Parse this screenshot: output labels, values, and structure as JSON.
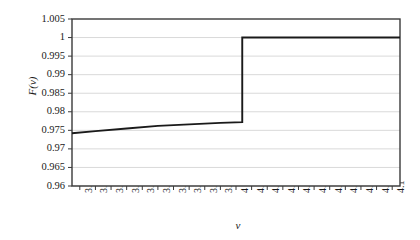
{
  "chart_data": {
    "type": "line",
    "title": "",
    "subtitle": "",
    "xlabel": "v",
    "ylabel": "F(v)",
    "xlim": [
      3.895,
      4.105
    ],
    "ylim": [
      0.96,
      1.005
    ],
    "grid": true,
    "legend": null,
    "x_ticks": [
      "3.9",
      "3.91",
      "3.92",
      "3.93",
      "3.94",
      "3.95",
      "3.96",
      "3.97",
      "3.98",
      "3.99",
      "4",
      "4.01",
      "4.02",
      "4.03",
      "4.04",
      "4.05",
      "4.06",
      "4.07",
      "4.08",
      "4.09",
      "4.1"
    ],
    "x_tick_values": [
      3.9,
      3.91,
      3.92,
      3.93,
      3.94,
      3.95,
      3.96,
      3.97,
      3.98,
      3.99,
      4.0,
      4.01,
      4.02,
      4.03,
      4.04,
      4.05,
      4.06,
      4.07,
      4.08,
      4.09,
      4.1
    ],
    "y_ticks": [
      "0.96",
      "0.965",
      "0.97",
      "0.975",
      "0.98",
      "0.985",
      "0.99",
      "0.995",
      "1",
      "1.005"
    ],
    "y_tick_values": [
      0.96,
      0.965,
      0.97,
      0.975,
      0.98,
      0.985,
      0.99,
      0.995,
      1.0,
      1.005
    ],
    "series": [
      {
        "name": "F(v)",
        "color": "#1a1a1a",
        "x": [
          3.895,
          3.91,
          3.93,
          3.95,
          3.97,
          3.99,
          4.004,
          4.004,
          4.02,
          4.05,
          4.08,
          4.105
        ],
        "y": [
          0.9742,
          0.9748,
          0.9755,
          0.9762,
          0.9766,
          0.977,
          0.9772,
          1.0,
          1.0,
          1.0,
          1.0,
          1.0
        ]
      }
    ],
    "annotations": [
      {
        "text": "step discontinuity",
        "x": 4.004,
        "y_from": 0.9772,
        "y_to": 1.0
      }
    ],
    "colors": {
      "line": "#1a1a1a",
      "grid": "#d9d9d9",
      "axis": "#3a3a3a",
      "background": "#ffffff",
      "text": "#1a1a1a"
    },
    "plot_area": {
      "left": 72,
      "top": 19,
      "right": 400,
      "bottom": 186
    }
  }
}
